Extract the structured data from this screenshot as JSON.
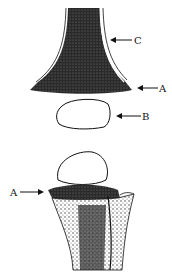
{
  "figure": {
    "type": "anatomical-line-drawing",
    "panels": [
      {
        "id": "top",
        "labels": [
          {
            "text": "C",
            "target": "bone-shaft-cortex"
          },
          {
            "text": "A",
            "target": "metaphysis-edge"
          },
          {
            "text": "B",
            "target": "separated-epiphysis"
          }
        ]
      },
      {
        "id": "bottom",
        "labels": [
          {
            "text": "A",
            "target": "growth-plate-edge"
          }
        ]
      }
    ]
  },
  "colors": {
    "ink": "#111111",
    "background": "#ffffff"
  }
}
